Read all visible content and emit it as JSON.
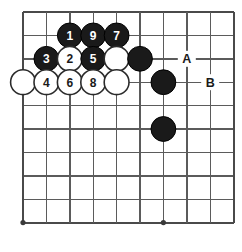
{
  "figure": {
    "kind": "go-board-diagram",
    "title": "",
    "background_color": "#ffffff",
    "line_color": "#5b5b5b",
    "black_stone_color": "#1a1a1a",
    "white_stone_color": "#ffffff"
  },
  "board": {
    "columns": 10,
    "rows": 10,
    "origin_x": 23,
    "origin_y": 12,
    "spacing": 23.4,
    "star_points": [
      {
        "col": 0,
        "row": 9
      },
      {
        "col": 6,
        "row": 9
      }
    ]
  },
  "stones": [
    {
      "id": "b1",
      "color": "black",
      "label": "1",
      "col": 2,
      "row": 1
    },
    {
      "id": "b9",
      "color": "black",
      "label": "9",
      "col": 3,
      "row": 1
    },
    {
      "id": "b7",
      "color": "black",
      "label": "7",
      "col": 4,
      "row": 1
    },
    {
      "id": "b3",
      "color": "black",
      "label": "3",
      "col": 1,
      "row": 2
    },
    {
      "id": "w2",
      "color": "white",
      "label": "2",
      "col": 2,
      "row": 2
    },
    {
      "id": "b5",
      "color": "black",
      "label": "5",
      "col": 3,
      "row": 2
    },
    {
      "id": "w-r2c4",
      "color": "white",
      "label": "",
      "col": 4,
      "row": 2
    },
    {
      "id": "b-r2c5",
      "color": "black",
      "label": "",
      "col": 5,
      "row": 2
    },
    {
      "id": "w-r3c0",
      "color": "white",
      "label": "",
      "col": 0,
      "row": 3
    },
    {
      "id": "w4",
      "color": "white",
      "label": "4",
      "col": 1,
      "row": 3
    },
    {
      "id": "w6",
      "color": "white",
      "label": "6",
      "col": 2,
      "row": 3
    },
    {
      "id": "w8",
      "color": "white",
      "label": "8",
      "col": 3,
      "row": 3
    },
    {
      "id": "w-r3c4",
      "color": "white",
      "label": "",
      "col": 4,
      "row": 3
    },
    {
      "id": "b-r3c6",
      "color": "black",
      "label": "",
      "col": 6,
      "row": 3
    },
    {
      "id": "b-r5c6",
      "color": "black",
      "label": "",
      "col": 6,
      "row": 5
    }
  ],
  "point_labels": [
    {
      "id": "label-a",
      "text": "A",
      "col": 7,
      "row": 2
    },
    {
      "id": "label-b",
      "text": "B",
      "col": 8,
      "row": 3
    }
  ]
}
